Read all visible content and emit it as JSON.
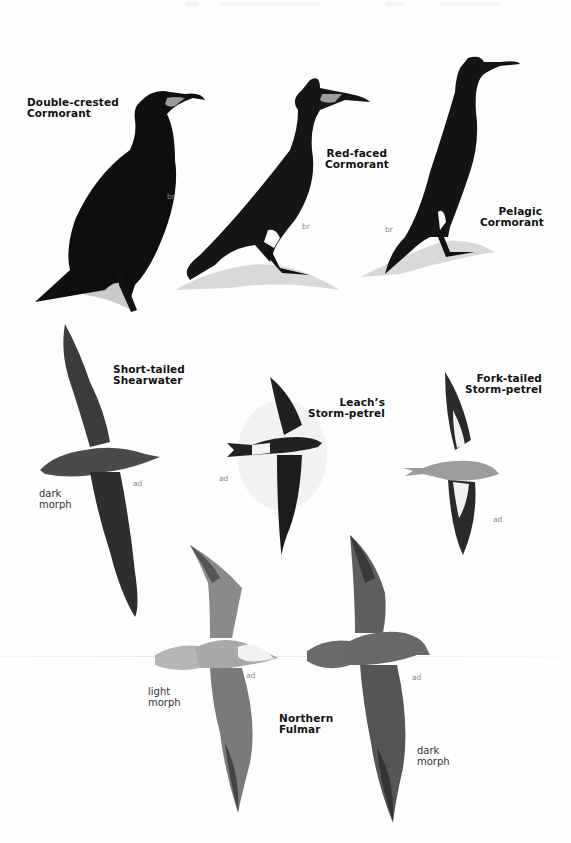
{
  "page": {
    "background": "#fefefe",
    "ink": "#111111"
  },
  "plates": [
    {
      "id": "double-crested-cormorant",
      "name_lines": [
        "Double-crested",
        "Cormorant"
      ],
      "age_label": "br"
    },
    {
      "id": "red-faced-cormorant",
      "name_lines": [
        "Red-faced",
        "Cormorant"
      ],
      "age_label": "br"
    },
    {
      "id": "pelagic-cormorant",
      "name_lines": [
        "Pelagic",
        "Cormorant"
      ],
      "age_label": "br"
    },
    {
      "id": "short-tailed-shearwater",
      "name_lines": [
        "Short-tailed",
        "Shearwater"
      ],
      "age_label": "ad",
      "morph_lines": [
        "dark",
        "morph"
      ]
    },
    {
      "id": "leachs-storm-petrel",
      "name_lines": [
        "Leach’s",
        "Storm-petrel"
      ],
      "age_label": "ad"
    },
    {
      "id": "fork-tailed-storm-petrel",
      "name_lines": [
        "Fork-tailed",
        "Storm-petrel"
      ],
      "age_label": "ad"
    },
    {
      "id": "northern-fulmar",
      "name_lines": [
        "Northern",
        "Fulmar"
      ],
      "variants": [
        {
          "age_label": "ad",
          "morph_lines": [
            "light",
            "morph"
          ]
        },
        {
          "age_label": "ad",
          "morph_lines": [
            "dark",
            "morph"
          ]
        }
      ]
    }
  ]
}
